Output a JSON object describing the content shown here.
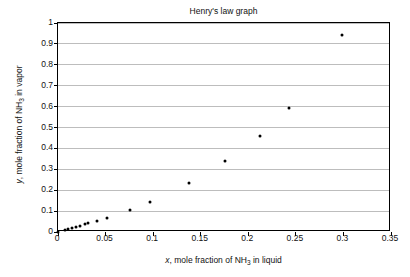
{
  "chart_data": {
    "type": "scatter",
    "title": "Henry's law graph",
    "xlabel": "x, mole fraction of NH3 in liquid",
    "ylabel": "y, mole fraction of NH3 in vapor",
    "xlabel_parts": {
      "var": "x",
      "text_before_sub": ", mole fraction of NH",
      "sub": "3",
      "text_after_sub": " in liquid"
    },
    "ylabel_parts": {
      "var": "y",
      "text_before_sub": ", mole fraction of NH",
      "sub": "3",
      "text_after_sub": " in vapor"
    },
    "xlim": [
      0,
      0.35
    ],
    "ylim": [
      0,
      1
    ],
    "xticks": [
      0,
      0.05,
      0.1,
      0.15,
      0.2,
      0.25,
      0.3,
      0.35
    ],
    "xtick_labels": [
      "0",
      "0.05",
      "0.1",
      "0.15",
      "0.2",
      "0.25",
      "0.3",
      "0.35"
    ],
    "yticks": [
      0,
      0.1,
      0.2,
      0.3,
      0.4,
      0.5,
      0.6,
      0.7,
      0.8,
      0.9,
      1
    ],
    "ytick_labels": [
      "0",
      "0.1",
      "0.2",
      "0.3",
      "0.4",
      "0.5",
      "0.6",
      "0.7",
      "0.8",
      "0.9",
      "1"
    ],
    "grid": {
      "horizontal": true,
      "vertical": false,
      "color": "#bdbdbd"
    },
    "legend": null,
    "marker": {
      "shape": "circle",
      "color": "#000000",
      "size_px": 3
    },
    "series": [
      {
        "name": "NH3 vapor-liquid equilibrium",
        "points": [
          {
            "x": 0.0,
            "y": 0.0
          },
          {
            "x": 0.007,
            "y": 0.01
          },
          {
            "x": 0.011,
            "y": 0.016
          },
          {
            "x": 0.015,
            "y": 0.02
          },
          {
            "x": 0.019,
            "y": 0.026
          },
          {
            "x": 0.023,
            "y": 0.03
          },
          {
            "x": 0.028,
            "y": 0.036
          },
          {
            "x": 0.032,
            "y": 0.041
          },
          {
            "x": 0.041,
            "y": 0.054
          },
          {
            "x": 0.051,
            "y": 0.067
          },
          {
            "x": 0.076,
            "y": 0.105
          },
          {
            "x": 0.097,
            "y": 0.145
          },
          {
            "x": 0.138,
            "y": 0.235
          },
          {
            "x": 0.176,
            "y": 0.341
          },
          {
            "x": 0.212,
            "y": 0.46
          },
          {
            "x": 0.243,
            "y": 0.595
          },
          {
            "x": 0.298,
            "y": 0.942
          }
        ]
      }
    ]
  },
  "figure": {
    "background": "#ffffff",
    "axis_color": "#000000",
    "text_color": "#111111"
  }
}
